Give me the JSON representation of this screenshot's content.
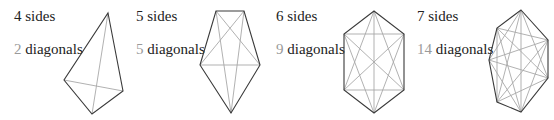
{
  "colors": {
    "side": "#3a3a3a",
    "diagonal": "#a8a8a8",
    "diag_number": "#9a9a9a",
    "text": "#222222"
  },
  "polygons": [
    {
      "sides_label": "4 sides",
      "diagonals_count": "2",
      "diagonals_word": " diagonals",
      "sides_pos": [
        14,
        9
      ],
      "diag_pos": [
        14,
        42
      ],
      "vertices": [
        [
          108,
          13
        ],
        [
          123,
          91
        ],
        [
          92,
          114
        ],
        [
          64,
          80
        ]
      ]
    },
    {
      "sides_label": "5 sides",
      "diagonals_count": "5",
      "diagonals_word": " diagonals",
      "sides_pos": [
        136,
        9
      ],
      "diag_pos": [
        136,
        42
      ],
      "vertices": [
        [
          216,
          11
        ],
        [
          244,
          11
        ],
        [
          260,
          65
        ],
        [
          231,
          113
        ],
        [
          200,
          65
        ]
      ]
    },
    {
      "sides_label": "6 sides",
      "diagonals_count": "9",
      "diagonals_word": " diagonals",
      "sides_pos": [
        276,
        9
      ],
      "diag_pos": [
        276,
        42
      ],
      "vertices": [
        [
          374,
          11
        ],
        [
          404,
          34
        ],
        [
          404,
          90
        ],
        [
          374,
          113
        ],
        [
          344,
          90
        ],
        [
          344,
          34
        ]
      ]
    },
    {
      "sides_label": "7 sides",
      "diagonals_count": "14",
      "diagonals_word": " diagonals",
      "sides_pos": [
        417,
        9
      ],
      "diag_pos": [
        417,
        42
      ],
      "vertices": [
        [
          521,
          10
        ],
        [
          548,
          40
        ],
        [
          548,
          78
        ],
        [
          521,
          112
        ],
        [
          497,
          102
        ],
        [
          489,
          60
        ],
        [
          497,
          28
        ]
      ]
    }
  ]
}
